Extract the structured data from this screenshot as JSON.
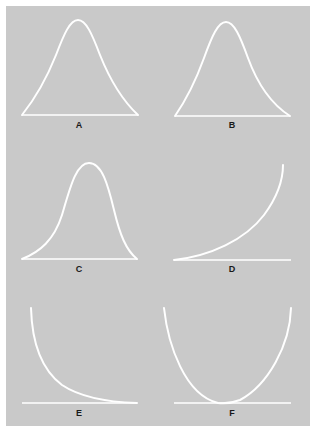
{
  "figure": {
    "background_color": "#c9c9c9",
    "curve_color": "#ffffff",
    "label_color": "#1a1a1a",
    "panels": [
      {
        "id": "A",
        "label": "A",
        "shape": "symmetric bell curve (normal distribution)"
      },
      {
        "id": "B",
        "label": "B",
        "shape": "symmetric bell curve (normal distribution)"
      },
      {
        "id": "C",
        "label": "C",
        "shape": "negatively skewed bell curve (long left tail)"
      },
      {
        "id": "D",
        "label": "D",
        "shape": "J-shaped increasing curve"
      },
      {
        "id": "E",
        "label": "E",
        "shape": "reverse J-shaped decreasing curve"
      },
      {
        "id": "F",
        "label": "F",
        "shape": "U-shaped curve"
      }
    ]
  }
}
